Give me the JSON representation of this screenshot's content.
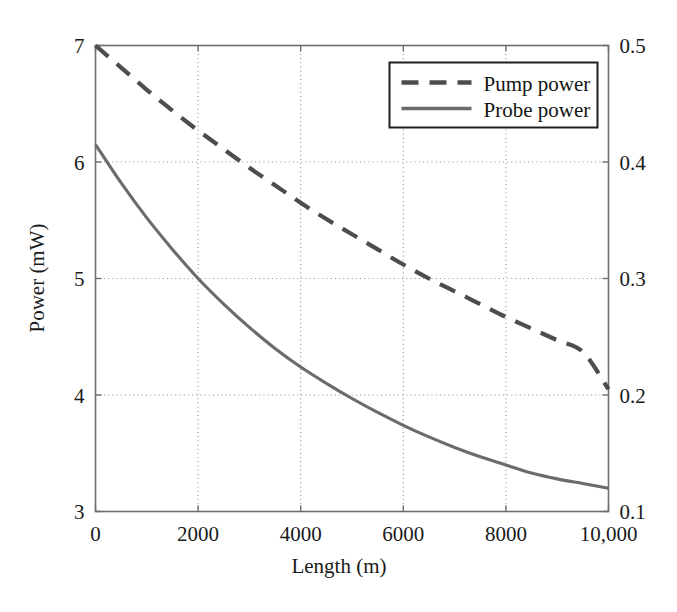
{
  "figure": {
    "background": "#ffffff",
    "width": 677,
    "height": 612
  },
  "chart_data": {
    "type": "line",
    "title": "",
    "xlabel": "Length (m)",
    "ylabel": "Power (mW)",
    "y2label": "",
    "xlim": [
      0,
      10000
    ],
    "ylim": [
      3,
      7
    ],
    "y2lim": [
      0.1,
      0.5
    ],
    "grid": true,
    "grid_style": "dotted",
    "legend_position": "upper-right-inside",
    "xticks": [
      0,
      2000,
      4000,
      6000,
      8000,
      10000
    ],
    "xticklabels": [
      "0",
      "2000",
      "4000",
      "6000",
      "8000",
      "10,000"
    ],
    "yticks": [
      3,
      4,
      5,
      6,
      7
    ],
    "yticklabels": [
      "3",
      "4",
      "5",
      "6",
      "7"
    ],
    "y2ticks": [
      0.1,
      0.2,
      0.3,
      0.4,
      0.5
    ],
    "y2ticklabels": [
      "0.1",
      "0.2",
      "0.3",
      "0.4",
      "0.5"
    ],
    "series": [
      {
        "name": "Pump power",
        "axis": "right",
        "style": "dashed",
        "color": "#4d4d4d",
        "x": [
          0,
          500,
          1000,
          1500,
          2000,
          2500,
          3000,
          3500,
          4000,
          4500,
          5000,
          5500,
          6000,
          6500,
          7000,
          7500,
          8000,
          8500,
          9000,
          9500,
          10000
        ],
        "values": [
          0.5,
          0.481,
          0.462,
          0.444,
          0.427,
          0.411,
          0.395,
          0.38,
          0.365,
          0.351,
          0.338,
          0.325,
          0.312,
          0.3,
          0.289,
          0.278,
          0.267,
          0.257,
          0.247,
          0.237,
          0.205
        ]
      },
      {
        "name": "Probe power",
        "axis": "left",
        "style": "solid",
        "color": "#6b6b6b",
        "x": [
          0,
          500,
          1000,
          1500,
          2000,
          2500,
          3000,
          3500,
          4000,
          4500,
          5000,
          5500,
          6000,
          6500,
          7000,
          7500,
          8000,
          8500,
          9000,
          9500,
          10000
        ],
        "values": [
          6.15,
          5.82,
          5.52,
          5.25,
          5.0,
          4.78,
          4.58,
          4.4,
          4.24,
          4.1,
          3.97,
          3.85,
          3.74,
          3.64,
          3.55,
          3.47,
          3.4,
          3.33,
          3.28,
          3.24,
          3.2
        ]
      }
    ],
    "legend": [
      {
        "label": "Pump power",
        "style": "dashed"
      },
      {
        "label": "Probe power",
        "style": "solid"
      }
    ]
  }
}
